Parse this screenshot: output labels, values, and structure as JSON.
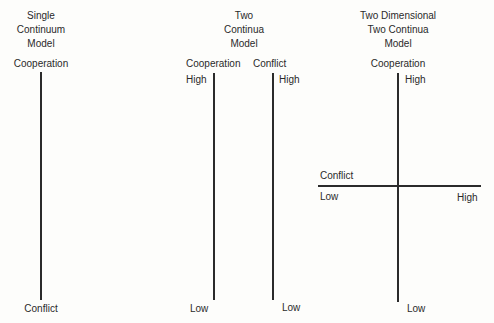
{
  "panels": [
    {
      "title_lines": [
        "Single",
        "Continuum",
        "Model"
      ],
      "top_label": "Cooperation",
      "bottom_label": "Conflict"
    },
    {
      "title_lines": [
        "Two",
        "Continua",
        "Model"
      ],
      "cooperation_axis": {
        "name": "Cooperation",
        "top": "High",
        "bottom": "Low"
      },
      "conflict_axis": {
        "name": "Conflict",
        "top": "High",
        "bottom": "Low"
      }
    },
    {
      "title_lines": [
        "Two Dimensional",
        "Two Continua",
        "Model"
      ],
      "vertical_axis": {
        "name": "Cooperation",
        "top": "High",
        "bottom": "Low"
      },
      "horizontal_axis": {
        "name": "Conflict",
        "left": "Low",
        "right": "High"
      }
    }
  ]
}
